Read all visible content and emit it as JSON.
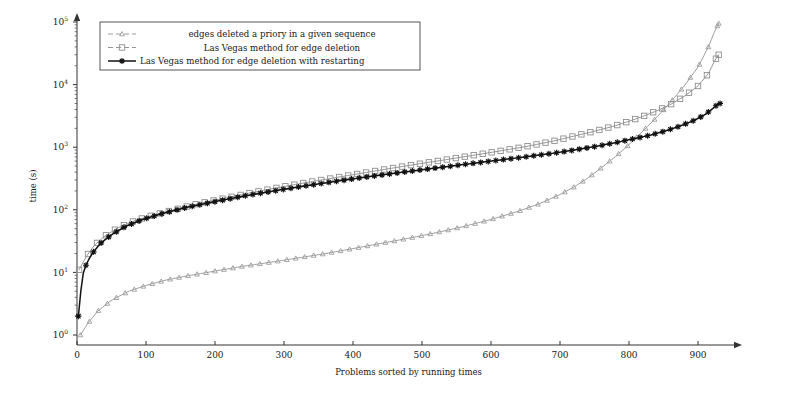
{
  "figure": {
    "background": "#ffffff",
    "width": 790,
    "height": 396
  },
  "axes": {
    "x_title": "Problems sorted by running times",
    "y_title": "time (s)",
    "x_ticks": [
      "0",
      "100",
      "200",
      "300",
      "400",
      "500",
      "600",
      "700",
      "800",
      "900"
    ],
    "y_ticks": [
      "10",
      "10",
      "10",
      "10",
      "10",
      "10"
    ],
    "y_tick_exponents": [
      "0",
      "1",
      "2",
      "3",
      "4",
      "5"
    ]
  },
  "legend": {
    "items": [
      {
        "label": "edges deleted a priory in a given sequence",
        "marker": "triangle-marker",
        "color": "#9a9a9a"
      },
      {
        "label": "Las Vegas method for edge deletion",
        "marker": "square-marker",
        "color": "#8f8f8f"
      },
      {
        "label": "Las Vegas method for edge deletion with restarting",
        "marker": "star-marker",
        "color": "#111111"
      }
    ]
  },
  "chart_data": {
    "type": "line",
    "title": "",
    "xlabel": "Problems sorted by running times",
    "ylabel": "time (s)",
    "xlim": [
      0,
      940
    ],
    "ylim": [
      1,
      100000
    ],
    "yscale": "log",
    "grid": false,
    "legend_position": "top-left",
    "series": [
      {
        "name": "edges deleted a priory in a given sequence",
        "marker": "triangle",
        "color": "#9a9a9a",
        "x": [
          5,
          15,
          30,
          50,
          75,
          100,
          130,
          160,
          200,
          240,
          280,
          320,
          360,
          400,
          440,
          480,
          520,
          560,
          600,
          640,
          670,
          700,
          720,
          740,
          760,
          780,
          800,
          820,
          840,
          860,
          880,
          900,
          915,
          925,
          930
        ],
        "y": [
          1.0,
          1.5,
          2.4,
          3.6,
          5.0,
          6.2,
          7.6,
          8.8,
          10.5,
          12.5,
          14.5,
          17.0,
          20.0,
          24.0,
          29.0,
          35.0,
          43.0,
          54.0,
          70.0,
          95.0,
          125.0,
          175.0,
          230.0,
          320.0,
          470.0,
          700.0,
          1100.0,
          1800.0,
          3000.0,
          5200.0,
          9500.0,
          19000.0,
          40000.0,
          75000.0,
          95000.0
        ]
      },
      {
        "name": "Las Vegas method for edge deletion",
        "marker": "square",
        "color": "#8f8f8f",
        "x": [
          3,
          8,
          15,
          25,
          40,
          60,
          85,
          110,
          140,
          175,
          210,
          250,
          290,
          330,
          370,
          410,
          450,
          490,
          530,
          570,
          610,
          650,
          690,
          720,
          750,
          780,
          800,
          820,
          840,
          860,
          880,
          900,
          915,
          925,
          930
        ],
        "y": [
          11.0,
          14.0,
          19.0,
          27.0,
          38.0,
          52.0,
          68.0,
          82.0,
          100.0,
          125.0,
          150.0,
          185.0,
          225.0,
          270.0,
          320.0,
          380.0,
          450.0,
          530.0,
          620.0,
          730.0,
          860.0,
          1020.0,
          1250.0,
          1500.0,
          1800.0,
          2200.0,
          2600.0,
          3100.0,
          3800.0,
          4800.0,
          6500.0,
          9500.0,
          15000.0,
          25000.0,
          30000.0
        ],
        "start_value": 11.0,
        "end_value": 30000.0
      },
      {
        "name": "Las Vegas method for edge deletion with restarting",
        "marker": "star",
        "color": "#111111",
        "x": [
          2,
          4,
          8,
          14,
          22,
          34,
          50,
          70,
          95,
          125,
          160,
          200,
          240,
          285,
          330,
          375,
          420,
          465,
          510,
          555,
          600,
          645,
          690,
          720,
          750,
          780,
          805,
          830,
          855,
          875,
          895,
          910,
          922,
          928,
          932
        ],
        "y": [
          2.0,
          3.5,
          9.0,
          14.0,
          20.0,
          29.0,
          40.0,
          54.0,
          70.0,
          88.0,
          110.0,
          135.0,
          165.0,
          200.0,
          240.0,
          285.0,
          335.0,
          390.0,
          450.0,
          520.0,
          600.0,
          690.0,
          800.0,
          900.0,
          1020.0,
          1180.0,
          1350.0,
          1550.0,
          1850.0,
          2200.0,
          2700.0,
          3300.0,
          4200.0,
          4800.0,
          5000.0
        ],
        "start_value": 2.0,
        "end_value": 5000.0
      }
    ]
  }
}
